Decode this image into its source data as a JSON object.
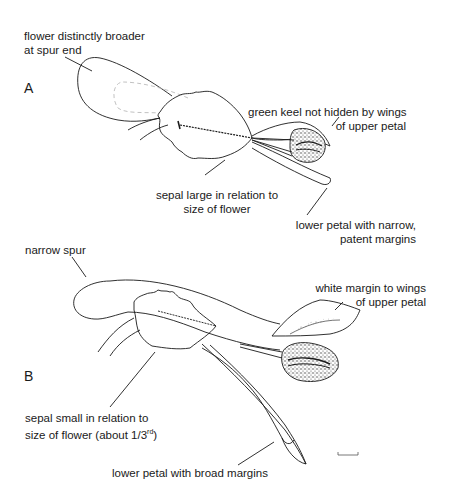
{
  "figure": {
    "panels": [
      {
        "id": "A",
        "letter": "A",
        "annotations": [
          {
            "id": "spur",
            "line1": "flower distinctly broader",
            "line2": "at spur end"
          },
          {
            "id": "keel",
            "line1": "green keel not hidden by wings",
            "line2": "of upper petal"
          },
          {
            "id": "sepal",
            "line1": "sepal large in relation to",
            "line2": "size of flower"
          },
          {
            "id": "lower_petal",
            "line1": "lower petal with narrow,",
            "line2": "patent margins"
          }
        ]
      },
      {
        "id": "B",
        "letter": "B",
        "annotations": [
          {
            "id": "spur",
            "line1": "narrow spur"
          },
          {
            "id": "wing_margin",
            "line1": "white margin to wings",
            "line2": "of upper petal"
          },
          {
            "id": "sepal",
            "line1": "sepal small in relation to",
            "line2": "size of flower (about 1/3",
            "sup": "rd",
            "suffix": ")"
          },
          {
            "id": "lower_petal",
            "line1": "lower petal with broad margins"
          }
        ]
      }
    ],
    "scale_bar": {
      "visible": true,
      "unit_label": ""
    },
    "colors": {
      "ink": "#1a1a1a",
      "stipple": "#333333",
      "dashed_outline": "#bbbbbb",
      "background": "#ffffff"
    }
  }
}
